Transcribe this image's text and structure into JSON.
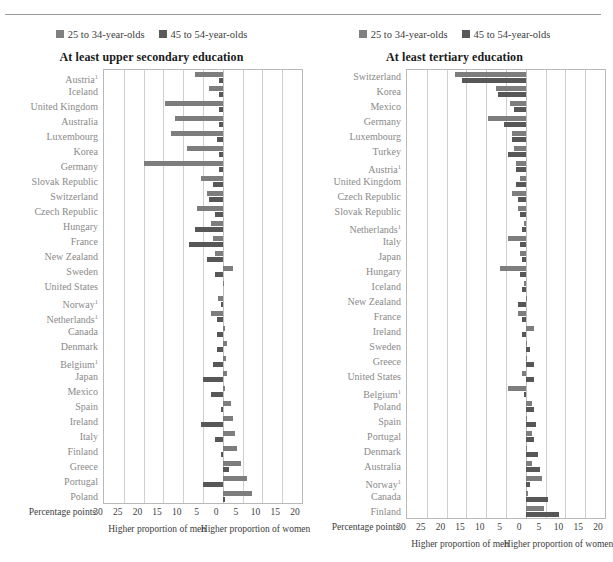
{
  "page": {
    "cut_header_text": "",
    "background": "#ffffff"
  },
  "colors": {
    "young_bar": "#7d7d7d",
    "old_bar": "#575757",
    "gridline": "#cfcfcf",
    "label_text": "#8a8a8a",
    "title_text": "#1a1a1a"
  },
  "legend": {
    "young_label": "25 to 34-year-olds",
    "old_label": "45 to 54-year-olds"
  },
  "axis": {
    "axis_title": "Percentage points",
    "ticks": [
      "30",
      "25",
      "20",
      "15",
      "10",
      "5",
      "0",
      "5",
      "10",
      "15",
      "20"
    ],
    "note_men": "Higher proportion of men",
    "note_women": "Higher proportion of women"
  },
  "chart_data": [
    {
      "type": "bar",
      "title": "At least upper secondary education",
      "xlabel": "Percentage points",
      "ylabel": "",
      "xlim": [
        -30,
        20
      ],
      "grid": true,
      "orientation": "horizontal-diverging",
      "legend_position": "top",
      "series": [
        {
          "name": "25 to 34-year-olds",
          "values": [
            -7.0,
            -3.5,
            -14.5,
            -12.0,
            -13.0,
            -9.0,
            -20.0,
            -5.5,
            -4.0,
            -6.5,
            -3.0,
            -2.5,
            -2.0,
            2.5,
            0.3,
            -1.2,
            -3.0,
            0.5,
            1.0,
            0.8,
            1.0,
            0.5,
            2.0,
            2.5,
            3.0,
            3.5,
            4.5,
            6.0,
            7.5,
            12.0
          ]
        },
        {
          "name": "45 to 54-year-olds",
          "values": [
            -1.0,
            -1.0,
            -1.0,
            -1.0,
            -1.5,
            -1.0,
            -1.0,
            -2.5,
            -3.5,
            -2.0,
            -7.0,
            -8.5,
            -4.0,
            -2.0,
            0.0,
            -0.5,
            -1.5,
            -1.5,
            -1.5,
            -2.5,
            -5.0,
            -3.0,
            -0.5,
            -5.5,
            -2.0,
            -0.5,
            1.5,
            -5.0,
            0.5,
            9.0
          ]
        }
      ],
      "categories": [
        "Austria¹",
        "Iceland",
        "United Kingdom",
        "Australia",
        "Luxembourg",
        "Korea",
        "Germany",
        "Slovak Republic",
        "Switzerland",
        "Czech Republic",
        "Hungary",
        "France",
        "New Zealand",
        "Sweden",
        "United States",
        "Norway¹",
        "Netherlands¹",
        "Canada",
        "Denmark",
        "Belgium¹",
        "Japan",
        "Mexico",
        "Spain",
        "Ireland",
        "Italy",
        "Finland",
        "Greece",
        "Portugal",
        "Poland"
      ]
    },
    {
      "type": "bar",
      "title": "At least tertiary education",
      "xlabel": "Percentage points",
      "ylabel": "",
      "xlim": [
        -30,
        20
      ],
      "grid": true,
      "orientation": "horizontal-diverging",
      "legend_position": "top",
      "series": [
        {
          "name": "25 to 34-year-olds",
          "values": [
            -18.0,
            -7.5,
            -4.0,
            -9.5,
            -3.5,
            -3.0,
            -2.5,
            -1.5,
            -3.5,
            -2.0,
            -0.5,
            -4.5,
            -1.5,
            -6.5,
            -0.5,
            0.3,
            -2.0,
            2.0,
            0.3,
            0.3,
            -1.0,
            -4.5,
            1.5,
            0.3,
            1.5,
            0.3,
            1.5,
            4.0,
            0.5,
            4.5,
            5.0
          ]
        },
        {
          "name": "45 to 54-year-olds",
          "values": [
            -16.0,
            -7.0,
            -3.0,
            -5.5,
            -3.5,
            -4.5,
            -2.5,
            -2.5,
            -2.0,
            -1.5,
            -1.0,
            -1.5,
            -1.0,
            -1.5,
            -1.0,
            -2.0,
            -1.0,
            -1.0,
            1.0,
            2.0,
            2.0,
            -0.5,
            2.0,
            2.5,
            2.0,
            3.0,
            3.5,
            1.0,
            5.5,
            8.5,
            14.0
          ]
        }
      ],
      "categories": [
        "Switzerland",
        "Korea",
        "Mexico",
        "Germany",
        "Luxembourg",
        "Turkey",
        "Austria¹",
        "United Kingdom",
        "Czech Republic",
        "Slovak Republic",
        "Netherlands¹",
        "Italy",
        "Japan",
        "Hungary",
        "Iceland",
        "New Zealand",
        "France",
        "Ireland",
        "Sweden",
        "Greece",
        "United States",
        "Belgium¹",
        "Poland",
        "Spain",
        "Portugal",
        "Denmark",
        "Australia",
        "Norway¹",
        "Canada",
        "Finland"
      ]
    }
  ]
}
